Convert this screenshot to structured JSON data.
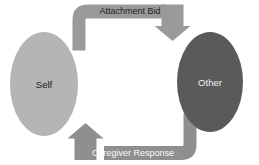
{
  "diagram": {
    "canvas": {
      "width": 259,
      "height": 165,
      "background": "#ffffff"
    },
    "nodes": [
      {
        "id": "self",
        "label": "Self",
        "shape": "ellipse",
        "fill": "#b5b5b5",
        "text_color": "#1a1a1a",
        "cx": 44,
        "cy": 84,
        "rx": 34,
        "ry": 52
      },
      {
        "id": "other",
        "label": "Other",
        "shape": "ellipse",
        "fill": "#5a5a5a",
        "text_color": "#f2f2f2",
        "cx": 210,
        "cy": 82,
        "rx": 33,
        "ry": 50
      }
    ],
    "edges": [
      {
        "id": "attachment-bid",
        "label": "Attachment Bid",
        "from": "self",
        "to": "other",
        "direction": "left-to-right",
        "fill": "#9a9a9a",
        "text_color": "#1d1d1d",
        "label_x": 130,
        "label_y": 11
      },
      {
        "id": "caregiver-response",
        "label": "Caregiver Response",
        "from": "other",
        "to": "self",
        "direction": "right-to-left",
        "fill": "#8f8f8f",
        "text_color": "#fafafa",
        "label_x": 133,
        "label_y": 153
      }
    ]
  }
}
